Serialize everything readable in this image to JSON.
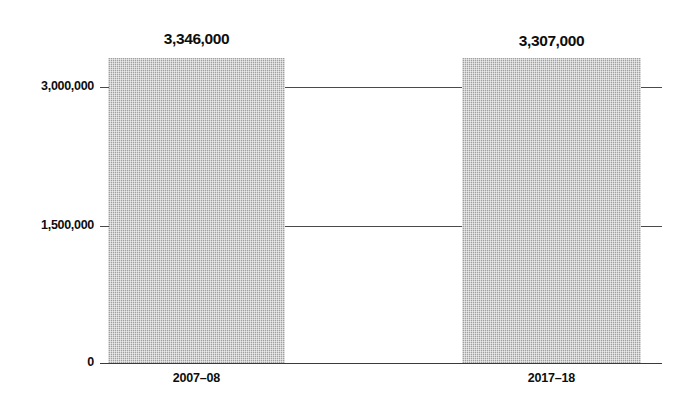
{
  "chart_data": {
    "type": "bar",
    "title": "",
    "subtitle": "",
    "xlabel": "",
    "ylabel": "",
    "categories": [
      "2007–08",
      "2017–18"
    ],
    "values": [
      3346000,
      3307000
    ],
    "value_labels": [
      "3,346,000",
      "3,307,000"
    ],
    "ylim": [
      0,
      3600000
    ],
    "yticks": [
      0,
      1500000,
      3000000
    ],
    "ytick_labels": [
      "0",
      "1,500,000",
      "3,000,000"
    ],
    "grid": true,
    "legend": false,
    "legend_position": "none",
    "series": [
      {
        "name": "",
        "values": [
          3346000,
          3307000
        ]
      }
    ],
    "annotations": []
  },
  "axis": {
    "y_ticks": [
      {
        "label": "3,000,000",
        "value": 3000000
      },
      {
        "label": "1,500,000",
        "value": 1500000
      },
      {
        "label": "0",
        "value": 0
      }
    ],
    "x_categories": [
      {
        "label": "2007–08"
      },
      {
        "label": "2017–18"
      }
    ]
  },
  "bars": [
    {
      "category": "2007–08",
      "value_label": "3,346,000",
      "value": 3346000
    },
    {
      "category": "2017–18",
      "value_label": "3,307,000",
      "value": 3307000
    }
  ],
  "colors": {
    "bar_fill": "#b2b2b2",
    "axis_line": "#3a3a3a",
    "grid_line": "#4a4a4a",
    "text": "#0d0d0d",
    "background": "#ffffff"
  }
}
